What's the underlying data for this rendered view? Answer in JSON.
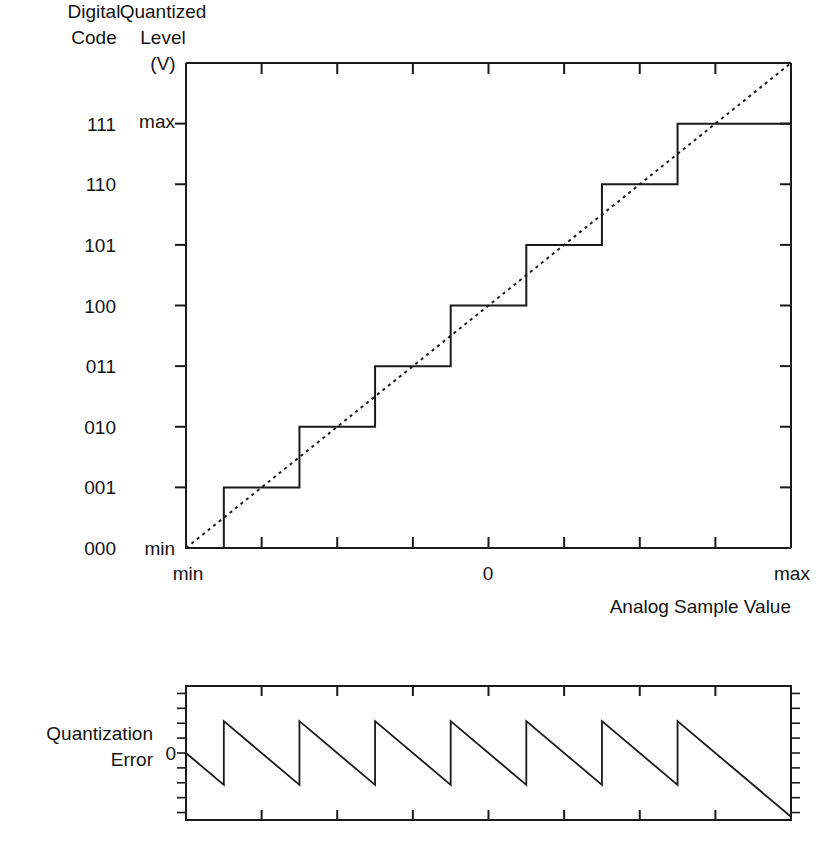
{
  "headers": {
    "digital_code_line1": "Digital",
    "digital_code_line2": "Code",
    "quantized_level_line1": "Quantized",
    "quantized_level_line2": "Level",
    "quantized_level_line3": "(V)"
  },
  "labels": {
    "x_axis_title": "Analog Sample Value",
    "error_label_line1": "Quantization",
    "error_label_line2": "Error",
    "error_zero": "0",
    "y_max": "max",
    "y_min": "min",
    "x_min": "min",
    "x_zero": "0",
    "x_max": "max"
  },
  "colors": {
    "ink": "#1a1a1a",
    "text": "#141414",
    "background": "#ffffff"
  },
  "chart_data": [
    {
      "type": "line",
      "name": "quantizer-transfer-function",
      "title": "",
      "xlabel": "Analog Sample Value",
      "ylabel": "Quantized Level (V)",
      "grid": false,
      "legend": "none",
      "xlim": [
        0,
        8
      ],
      "ylim": [
        0,
        8
      ],
      "x_tick_labels": [
        "min",
        "0",
        "max"
      ],
      "x_tick_label_positions": [
        0,
        4,
        8
      ],
      "x_tick_positions": [
        1,
        2,
        3,
        4,
        5,
        6,
        7
      ],
      "y_tick_positions": [
        1,
        2,
        3,
        4,
        5,
        6,
        7
      ],
      "y_tick_labels": [
        "min",
        "max"
      ],
      "y_tick_label_positions": [
        0,
        7
      ],
      "digital_codes": [
        "111",
        "110",
        "101",
        "100",
        "011",
        "010",
        "001",
        "000"
      ],
      "digital_code_levels": [
        7,
        6,
        5,
        4,
        3,
        2,
        1,
        0
      ],
      "series": [
        {
          "name": "staircase",
          "style": "solid",
          "points_x": [
            0,
            0.5,
            0.5,
            1.5,
            1.5,
            2.5,
            2.5,
            3.5,
            3.5,
            4.5,
            4.5,
            5.5,
            5.5,
            6.5,
            6.5,
            8
          ],
          "points_y": [
            0,
            0,
            1,
            1,
            2,
            2,
            3,
            3,
            4,
            4,
            5,
            5,
            6,
            6,
            7,
            7
          ]
        },
        {
          "name": "ideal-transfer",
          "style": "dotted",
          "points_x": [
            0,
            8
          ],
          "points_y": [
            0,
            8
          ]
        }
      ]
    },
    {
      "type": "line",
      "name": "quantization-error",
      "title": "",
      "xlabel": "",
      "ylabel": "Quantization Error",
      "grid": false,
      "legend": "none",
      "xlim": [
        0,
        8
      ],
      "ylim": [
        -1.05,
        1.05
      ],
      "x_tick_positions": [
        1,
        2,
        3,
        4,
        5,
        6,
        7
      ],
      "y_zero_label": "0",
      "series": [
        {
          "name": "sawtooth-error",
          "style": "solid",
          "points_x": [
            0,
            0.5,
            0.5,
            1.5,
            1.5,
            2.5,
            2.5,
            3.5,
            3.5,
            4.5,
            4.5,
            5.5,
            5.5,
            6.5,
            6.5,
            8
          ],
          "points_y": [
            0,
            -0.5,
            0.5,
            -0.5,
            0.5,
            -0.5,
            0.5,
            -0.5,
            0.5,
            -0.5,
            0.5,
            -0.5,
            0.5,
            -0.5,
            0.5,
            -1
          ]
        }
      ]
    }
  ]
}
